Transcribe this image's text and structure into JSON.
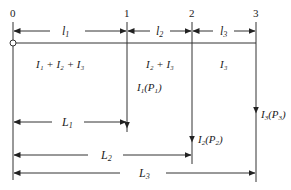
{
  "diagram": {
    "nodes": [
      {
        "label": "0",
        "x": 13
      },
      {
        "label": "1",
        "x": 127
      },
      {
        "label": "2",
        "x": 192
      },
      {
        "label": "3",
        "x": 256
      }
    ],
    "segment_lengths": [
      {
        "label": "l",
        "sub": "1"
      },
      {
        "label": "l",
        "sub": "2"
      },
      {
        "label": "l",
        "sub": "3"
      }
    ],
    "segment_currents": [
      {
        "text": "I₁ + I₂ + I₃"
      },
      {
        "text": "I₂ + I₃"
      },
      {
        "text": "I₃"
      }
    ],
    "loads": [
      {
        "main": "I",
        "sub": "1",
        "paren": "P",
        "psub": "1"
      },
      {
        "main": "I",
        "sub": "2",
        "paren": "P",
        "psub": "2"
      },
      {
        "main": "I",
        "sub": "3",
        "paren": "P",
        "psub": "3"
      }
    ],
    "distances": [
      {
        "label": "L",
        "sub": "1"
      },
      {
        "label": "L",
        "sub": "2"
      },
      {
        "label": "L",
        "sub": "3"
      }
    ],
    "colors": {
      "line": "#333333",
      "text": "#222222",
      "background": "#ffffff"
    }
  }
}
